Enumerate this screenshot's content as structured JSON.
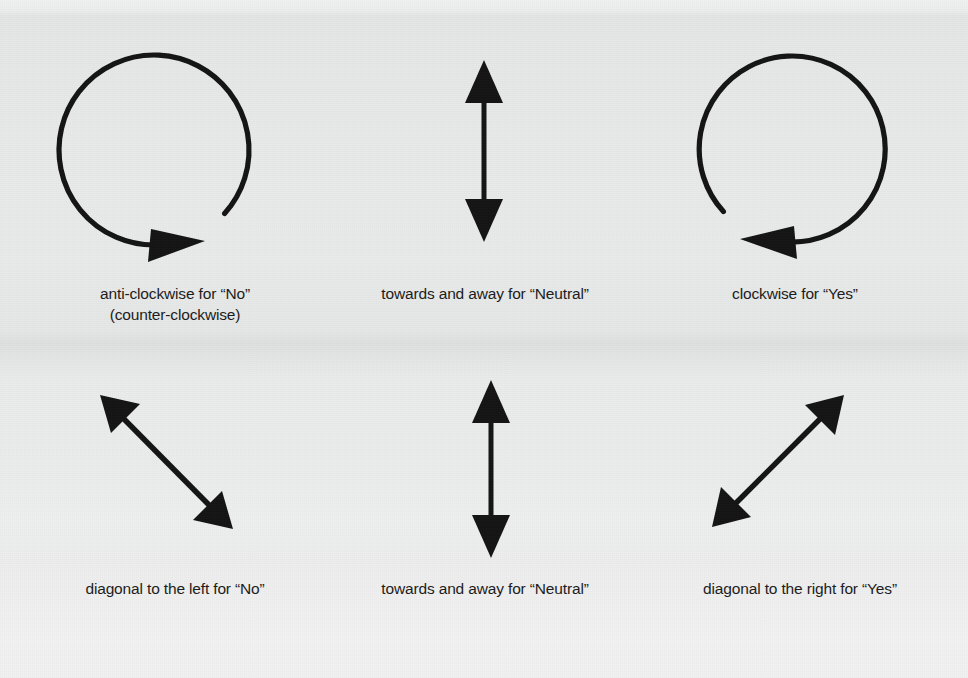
{
  "page": {
    "background_color": "#e8e9e9",
    "ink_color": "#141414",
    "width": 968,
    "height": 678
  },
  "diagram": {
    "type": "gesture-legend",
    "rows": [
      {
        "row_name": "circular-gestures",
        "cells": [
          {
            "glyph": "anticlockwise-circle-arrow-icon",
            "caption": "anti-clockwise for “No”\n(counter-clockwise)"
          },
          {
            "glyph": "vertical-double-arrow-icon",
            "caption": "towards and away for “Neutral”"
          },
          {
            "glyph": "clockwise-circle-arrow-icon",
            "caption": "clockwise for “Yes”"
          }
        ]
      },
      {
        "row_name": "linear-gestures",
        "cells": [
          {
            "glyph": "diagonal-left-double-arrow-icon",
            "caption": "diagonal to the left for “No”"
          },
          {
            "glyph": "vertical-double-arrow-icon",
            "caption": "towards and away for “Neutral”"
          },
          {
            "glyph": "diagonal-right-double-arrow-icon",
            "caption": "diagonal to the right for “Yes”"
          }
        ]
      }
    ]
  }
}
